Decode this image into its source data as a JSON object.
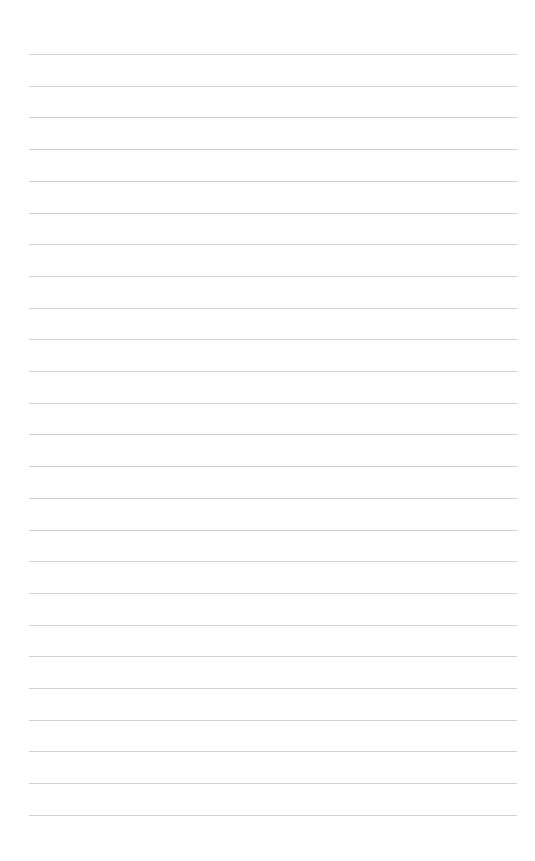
{
  "page": {
    "type": "lined-paper",
    "background": "#ffffff",
    "rule_color": "#c9c9c9",
    "line_count": 25,
    "first_line_y": 54,
    "line_spacing": 31.7,
    "line_left": 29,
    "line_right": 517
  }
}
